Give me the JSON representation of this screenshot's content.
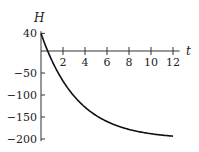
{
  "chart_data": {
    "type": "line",
    "title": "",
    "xlabel": "t",
    "ylabel": "H",
    "xlim": [
      0,
      12.5
    ],
    "ylim": [
      -205,
      45
    ],
    "x_ticks": [
      2,
      4,
      6,
      8,
      10,
      12
    ],
    "y_ticks": [
      40,
      -50,
      -100,
      -150,
      -200
    ],
    "x_tick_labels": [
      "2",
      "4",
      "6",
      "8",
      "10",
      "12"
    ],
    "y_tick_labels": [
      "40",
      "−50",
      "−100",
      "−150",
      "−200"
    ],
    "grid": false,
    "legend": null,
    "series": [
      {
        "name": "H(t)",
        "color": "#111111",
        "x": [
          0,
          0.5,
          1,
          1.5,
          2,
          3,
          4,
          5,
          6,
          7,
          8,
          9,
          10,
          11,
          12
        ],
        "values": [
          40,
          6,
          -22,
          -46,
          -68,
          -104,
          -128,
          -146,
          -160,
          -170,
          -178,
          -184,
          -188,
          -191,
          -193
        ]
      }
    ]
  }
}
